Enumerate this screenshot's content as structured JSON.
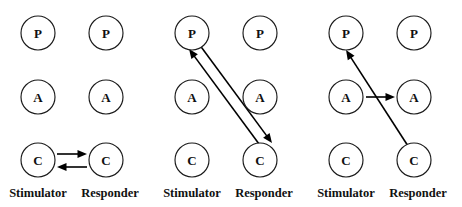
{
  "figure": {
    "title": "",
    "background_color": "#ffffff",
    "width": 462,
    "height": 207,
    "node_radius": 17,
    "column_labels": {
      "stimulator": "Stimulator",
      "responder": "Responder"
    },
    "row_labels": {
      "top": "P",
      "middle": "A",
      "bottom": "C"
    },
    "colors": {
      "stroke": "#1a1a1a",
      "arrow": "#000000",
      "text": "#101010",
      "node_fill": "#ffffff"
    },
    "panels": [
      {
        "id": "panel-1",
        "x": 0,
        "nodes": [
          {
            "id": "s-p",
            "label": "P",
            "cx": 38,
            "cy": 33,
            "column": "stimulator",
            "row": "top"
          },
          {
            "id": "r-p",
            "label": "P",
            "cx": 106,
            "cy": 33,
            "column": "responder",
            "row": "top"
          },
          {
            "id": "s-a",
            "label": "A",
            "cx": 38,
            "cy": 97,
            "column": "stimulator",
            "row": "middle"
          },
          {
            "id": "r-a",
            "label": "A",
            "cx": 106,
            "cy": 97,
            "column": "responder",
            "row": "middle"
          },
          {
            "id": "s-c",
            "label": "C",
            "cx": 38,
            "cy": 160,
            "column": "stimulator",
            "row": "bottom"
          },
          {
            "id": "r-c",
            "label": "C",
            "cx": 106,
            "cy": 160,
            "column": "responder",
            "row": "bottom"
          }
        ],
        "arrows": [
          {
            "id": "arrow-sc-to-rc",
            "from": "s-c",
            "to": "r-c",
            "direction": "right",
            "x1": 57,
            "y1": 154,
            "x2": 87,
            "y2": 154
          },
          {
            "id": "arrow-rc-to-sc",
            "from": "r-c",
            "to": "s-c",
            "direction": "left",
            "x1": 87,
            "y1": 167,
            "x2": 57,
            "y2": 167
          }
        ],
        "labels": [
          {
            "id": "label-stimulator",
            "text": "Stimulator",
            "x": 38,
            "y": 194
          },
          {
            "id": "label-responder",
            "text": "Responder",
            "x": 110,
            "y": 194
          }
        ]
      },
      {
        "id": "panel-2",
        "x": 154,
        "nodes": [
          {
            "id": "s-p",
            "label": "P",
            "cx": 38,
            "cy": 33,
            "column": "stimulator",
            "row": "top"
          },
          {
            "id": "r-p",
            "label": "P",
            "cx": 106,
            "cy": 33,
            "column": "responder",
            "row": "top"
          },
          {
            "id": "s-a",
            "label": "A",
            "cx": 38,
            "cy": 97,
            "column": "stimulator",
            "row": "middle"
          },
          {
            "id": "r-a",
            "label": "A",
            "cx": 106,
            "cy": 97,
            "column": "responder",
            "row": "middle"
          },
          {
            "id": "s-c",
            "label": "C",
            "cx": 38,
            "cy": 160,
            "column": "stimulator",
            "row": "bottom"
          },
          {
            "id": "r-c",
            "label": "C",
            "cx": 106,
            "cy": 160,
            "column": "responder",
            "row": "bottom"
          }
        ],
        "arrows": [
          {
            "id": "arrow-rc-to-sp",
            "from": "r-c",
            "to": "s-p",
            "direction": "up-left",
            "x1": 108,
            "y1": 148,
            "x2": 35,
            "y2": 49
          },
          {
            "id": "arrow-sp-to-rc",
            "from": "s-p",
            "to": "r-c",
            "direction": "down-right",
            "x1": 45,
            "y1": 44,
            "x2": 118,
            "y2": 143
          }
        ],
        "labels": [
          {
            "id": "label-stimulator",
            "text": "Stimulator",
            "x": 38,
            "y": 194
          },
          {
            "id": "label-responder",
            "text": "Responder",
            "x": 110,
            "y": 194
          }
        ]
      },
      {
        "id": "panel-3",
        "x": 308,
        "nodes": [
          {
            "id": "s-p",
            "label": "P",
            "cx": 38,
            "cy": 33,
            "column": "stimulator",
            "row": "top"
          },
          {
            "id": "r-p",
            "label": "P",
            "cx": 106,
            "cy": 33,
            "column": "responder",
            "row": "top"
          },
          {
            "id": "s-a",
            "label": "A",
            "cx": 38,
            "cy": 97,
            "column": "stimulator",
            "row": "middle"
          },
          {
            "id": "r-a",
            "label": "A",
            "cx": 106,
            "cy": 97,
            "column": "responder",
            "row": "middle"
          },
          {
            "id": "s-c",
            "label": "C",
            "cx": 38,
            "cy": 160,
            "column": "stimulator",
            "row": "bottom"
          },
          {
            "id": "r-c",
            "label": "C",
            "cx": 106,
            "cy": 160,
            "column": "responder",
            "row": "bottom"
          }
        ],
        "arrows": [
          {
            "id": "arrow-rc-to-sp",
            "from": "r-c",
            "to": "s-p",
            "direction": "up-left",
            "x1": 100,
            "y1": 146,
            "x2": 38,
            "y2": 50
          },
          {
            "id": "arrow-sa-to-ra",
            "from": "s-a",
            "to": "r-a",
            "direction": "right",
            "x1": 58,
            "y1": 97,
            "x2": 87,
            "y2": 97
          }
        ],
        "labels": [
          {
            "id": "label-stimulator",
            "text": "Stimulator",
            "x": 38,
            "y": 194
          },
          {
            "id": "label-responder",
            "text": "Responder",
            "x": 110,
            "y": 194
          }
        ]
      }
    ]
  }
}
